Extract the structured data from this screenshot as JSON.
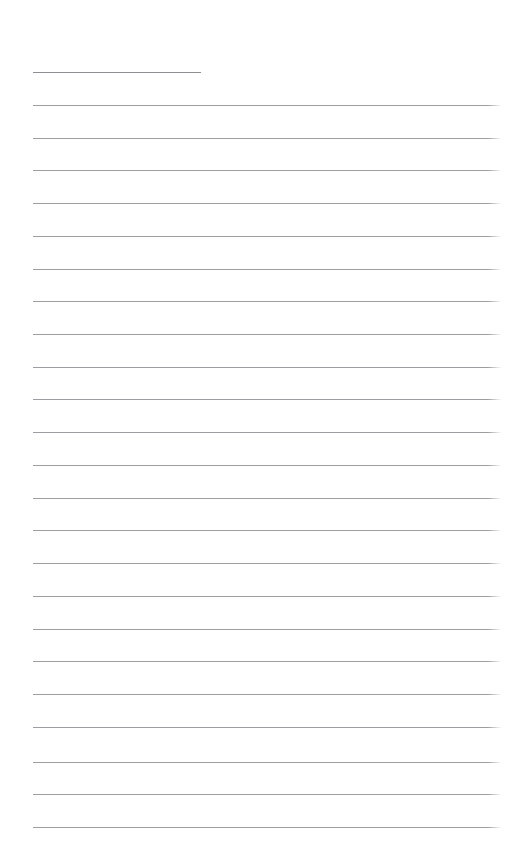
{
  "document": {
    "kind": "ruled-paper",
    "title": "",
    "background_color": "#ffffff",
    "width": 509,
    "height": 863,
    "text_content": "",
    "note": ""
  },
  "ruling": {
    "line_color": "#9a9a9e",
    "first_line_color": "#8e8e93",
    "line_thickness_px": 1,
    "line_spacing_px": 32.8,
    "left_margin_px": 33,
    "right_edge_px": 503,
    "first_line_right_edge_px": 201,
    "first_line_y_px": 72,
    "line_count": 24
  },
  "lines": [
    {
      "index": 1,
      "y": 72,
      "x1": 33,
      "x2": 201,
      "variant": "short",
      "text": ""
    },
    {
      "index": 2,
      "y": 105,
      "x1": 33,
      "x2": 503,
      "variant": "full",
      "text": ""
    },
    {
      "index": 3,
      "y": 138,
      "x1": 33,
      "x2": 503,
      "variant": "full",
      "text": ""
    },
    {
      "index": 4,
      "y": 170,
      "x1": 33,
      "x2": 503,
      "variant": "full",
      "text": ""
    },
    {
      "index": 5,
      "y": 203,
      "x1": 33,
      "x2": 503,
      "variant": "full",
      "text": ""
    },
    {
      "index": 6,
      "y": 236,
      "x1": 33,
      "x2": 503,
      "variant": "full",
      "text": ""
    },
    {
      "index": 7,
      "y": 269,
      "x1": 33,
      "x2": 503,
      "variant": "full",
      "text": ""
    },
    {
      "index": 8,
      "y": 301,
      "x1": 33,
      "x2": 503,
      "variant": "full",
      "text": ""
    },
    {
      "index": 9,
      "y": 334,
      "x1": 33,
      "x2": 503,
      "variant": "full",
      "text": ""
    },
    {
      "index": 10,
      "y": 367,
      "x1": 33,
      "x2": 503,
      "variant": "full",
      "text": ""
    },
    {
      "index": 11,
      "y": 399,
      "x1": 33,
      "x2": 503,
      "variant": "full",
      "text": ""
    },
    {
      "index": 12,
      "y": 432,
      "x1": 33,
      "x2": 503,
      "variant": "full",
      "text": ""
    },
    {
      "index": 13,
      "y": 465,
      "x1": 33,
      "x2": 503,
      "variant": "full",
      "text": ""
    },
    {
      "index": 14,
      "y": 498,
      "x1": 33,
      "x2": 503,
      "variant": "full",
      "text": ""
    },
    {
      "index": 15,
      "y": 530,
      "x1": 33,
      "x2": 503,
      "variant": "full",
      "text": ""
    },
    {
      "index": 16,
      "y": 563,
      "x1": 33,
      "x2": 503,
      "variant": "full",
      "text": ""
    },
    {
      "index": 17,
      "y": 596,
      "x1": 33,
      "x2": 503,
      "variant": "full",
      "text": ""
    },
    {
      "index": 18,
      "y": 629,
      "x1": 33,
      "x2": 503,
      "variant": "full",
      "text": ""
    },
    {
      "index": 19,
      "y": 661,
      "x1": 33,
      "x2": 503,
      "variant": "full",
      "text": ""
    },
    {
      "index": 20,
      "y": 694,
      "x1": 33,
      "x2": 503,
      "variant": "full",
      "text": ""
    },
    {
      "index": 21,
      "y": 727,
      "x1": 33,
      "x2": 503,
      "variant": "full",
      "text": ""
    },
    {
      "index": 22,
      "y": 762,
      "x1": 33,
      "x2": 503,
      "variant": "full",
      "text": ""
    },
    {
      "index": 23,
      "y": 794,
      "x1": 33,
      "x2": 503,
      "variant": "full",
      "text": ""
    },
    {
      "index": 24,
      "y": 827,
      "x1": 33,
      "x2": 503,
      "variant": "full",
      "text": ""
    }
  ]
}
